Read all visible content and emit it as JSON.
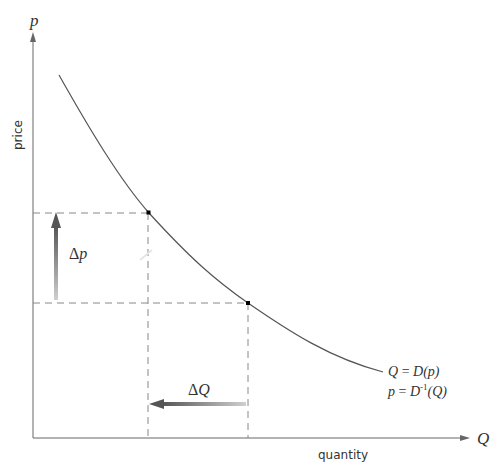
{
  "diagram": {
    "type": "demand-curve",
    "axes": {
      "y_symbol": "p",
      "y_label": "price",
      "x_symbol": "Q",
      "x_label": "quantity"
    },
    "curve_labels": {
      "line1_left": "Q",
      "line1_eq": " = ",
      "line1_right": "D(p)",
      "line2_left": "p",
      "line2_eq": " = ",
      "line2_func": "D",
      "line2_sup": "-1",
      "line2_arg": "(Q)"
    },
    "delta_p": {
      "delta": "Δ",
      "symbol": "p"
    },
    "delta_q": {
      "delta": "Δ",
      "symbol": "Q"
    },
    "colors": {
      "axis": "#555555",
      "curve": "#555555",
      "dashed": "#888888",
      "point": "#000000",
      "arrow_dark": "#555555",
      "arrow_light": "#c8c8c8"
    }
  }
}
